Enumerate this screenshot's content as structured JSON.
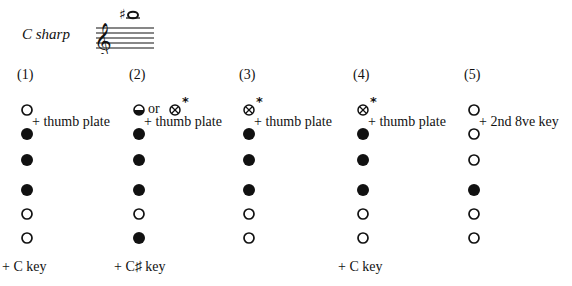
{
  "title": "C sharp",
  "staff": {
    "clef": "treble",
    "note": "C#6",
    "accidental": "sharp",
    "ledger_lines": 1
  },
  "legend": {
    "open": "open hole",
    "closed": "closed hole",
    "half": "half-hole (lower half covered)",
    "crossed": "crossed hole"
  },
  "fingerings": [
    {
      "label": "(1)",
      "holes": [
        "open",
        "closed",
        "closed",
        "closed",
        "open",
        "open"
      ],
      "top_annotation": "",
      "side_annotation": "+ thumb plate",
      "bottom_annotation": "+ C key"
    },
    {
      "label": "(2)",
      "holes": [
        "half",
        "closed",
        "closed",
        "closed",
        "open",
        "closed"
      ],
      "top_annotation": "or",
      "top_alt": "crossed",
      "top_asterisk": "*",
      "side_annotation": "+ thumb plate",
      "bottom_annotation": "+ C♯ key"
    },
    {
      "label": "(3)",
      "holes": [
        "crossed",
        "closed",
        "closed",
        "closed",
        "open",
        "open"
      ],
      "top_asterisk": "*",
      "side_annotation": "+ thumb plate",
      "bottom_annotation": ""
    },
    {
      "label": "(4)",
      "holes": [
        "crossed",
        "closed",
        "closed",
        "closed",
        "open",
        "open"
      ],
      "top_asterisk": "*",
      "side_annotation": "+ thumb plate",
      "bottom_annotation": "+ C key"
    },
    {
      "label": "(5)",
      "holes": [
        "open",
        "open",
        "open",
        "closed",
        "open",
        "open"
      ],
      "side_annotation": "+ 2nd 8ve key",
      "bottom_annotation": ""
    }
  ]
}
